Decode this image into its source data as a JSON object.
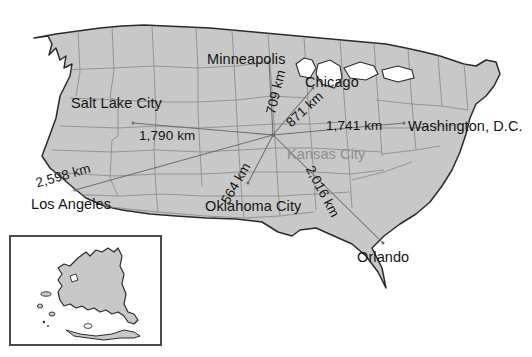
{
  "map": {
    "title": "United States distance map from Kansas City",
    "background_color": "#ffffff",
    "land_color": "#c8c8c8",
    "land_outline_color": "#2b2b2b",
    "state_border_color": "#8a8a8a",
    "route_line_color": "#6e6e6e",
    "label_color": "#141414",
    "hub_label_color": "#8e8e8e"
  },
  "hub": {
    "name": "Kansas City",
    "x": 273,
    "y": 135
  },
  "cities": [
    {
      "name": "Minneapolis",
      "label_x": 207,
      "label_y": 51,
      "dot_x": 269,
      "dot_y": 62
    },
    {
      "name": "Chicago",
      "label_x": 305,
      "label_y": 74,
      "dot_x": 313,
      "dot_y": 88
    },
    {
      "name": "Washington, D.C.",
      "label_x": 408,
      "label_y": 118,
      "dot_x": 404,
      "dot_y": 123
    },
    {
      "name": "Orlando",
      "label_x": 357,
      "label_y": 249,
      "dot_x": 383,
      "dot_y": 243
    },
    {
      "name": "Oklahoma City",
      "label_x": 205,
      "label_y": 198,
      "dot_x": 248,
      "dot_y": 183
    },
    {
      "name": "Los Angeles",
      "label_x": 31,
      "label_y": 196,
      "dot_x": 75,
      "dot_y": 190
    },
    {
      "name": "Salt Lake City",
      "label_x": 71,
      "label_y": 95,
      "dot_x": 133,
      "dot_y": 123
    }
  ],
  "routes": [
    {
      "to": "Minneapolis",
      "distance": "709 km",
      "label_x": 263,
      "label_y": 112,
      "rotation": -76
    },
    {
      "to": "Chicago",
      "distance": "871 km",
      "label_x": 283,
      "label_y": 119,
      "rotation": -43
    },
    {
      "to": "Washington, D.C.",
      "distance": "1,741 km",
      "label_x": 326,
      "label_y": 118,
      "rotation": 0
    },
    {
      "to": "Orlando",
      "distance": "2,016 km",
      "label_x": 316,
      "label_y": 163,
      "rotation": 62
    },
    {
      "to": "Oklahoma City",
      "distance": "564 km",
      "label_x": 218,
      "label_y": 199,
      "rotation": -60
    },
    {
      "to": "Los Angeles",
      "distance": "2,598 km",
      "label_x": 34,
      "label_y": 176,
      "rotation": -16
    },
    {
      "to": "Salt Lake City",
      "distance": "1,790 km",
      "label_x": 139,
      "label_y": 128,
      "rotation": 0
    }
  ],
  "inset": {
    "name": "Alaska",
    "x": 10,
    "y": 236,
    "width": 151,
    "height": 109,
    "border_color": "#4a4a4a",
    "fill_color": "#c8c8c8"
  }
}
